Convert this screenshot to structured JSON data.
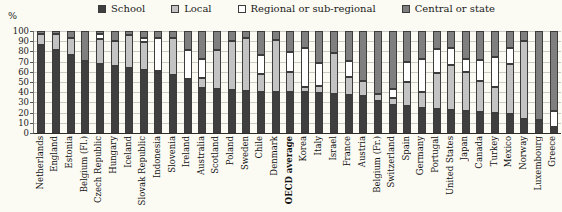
{
  "chart_data": {
    "type": "stacked-bar",
    "title": "",
    "ylabel": "%",
    "ylim": [
      0,
      100
    ],
    "yticks": [
      100,
      90,
      80,
      70,
      60,
      50,
      40,
      30,
      20,
      10,
      0
    ],
    "grid": true,
    "legend_position": "top",
    "legend": [
      {
        "key": "school",
        "label": "School",
        "color": "#3f3f3f"
      },
      {
        "key": "local",
        "label": "Local",
        "color": "#c3c3c3"
      },
      {
        "key": "regional",
        "label": "Regional or sub-regional",
        "color": "#ffffff"
      },
      {
        "key": "central",
        "label": "Central or state",
        "color": "#7f7f7f"
      }
    ],
    "rows": [
      {
        "country": "Netherlands",
        "school": 86,
        "local": 11,
        "regional": 0,
        "central": 3,
        "bold": false
      },
      {
        "country": "England",
        "school": 81,
        "local": 16,
        "regional": 0,
        "central": 3,
        "bold": false
      },
      {
        "country": "Estonia",
        "school": 76,
        "local": 17,
        "regional": 0,
        "central": 7,
        "bold": false
      },
      {
        "country": "Belgium (Fl.)",
        "school": 71,
        "local": 0,
        "regional": 0,
        "central": 29,
        "bold": false
      },
      {
        "country": "Czech Republic",
        "school": 68,
        "local": 24,
        "regional": 5,
        "central": 3,
        "bold": false
      },
      {
        "country": "Hungary",
        "school": 66,
        "local": 24,
        "regional": 0,
        "central": 10,
        "bold": false
      },
      {
        "country": "Iceland",
        "school": 64,
        "local": 32,
        "regional": 0,
        "central": 4,
        "bold": false
      },
      {
        "country": "Slovak Republic",
        "school": 62,
        "local": 27,
        "regional": 4,
        "central": 7,
        "bold": false
      },
      {
        "country": "Indonesia",
        "school": 59,
        "local": 2,
        "regional": 32,
        "central": 7,
        "bold": false
      },
      {
        "country": "Slovenia",
        "school": 57,
        "local": 36,
        "regional": 0,
        "central": 7,
        "bold": false
      },
      {
        "country": "Ireland",
        "school": 53,
        "local": 0,
        "regional": 28,
        "central": 19,
        "bold": false
      },
      {
        "country": "Australia",
        "school": 44,
        "local": 10,
        "regional": 19,
        "central": 27,
        "bold": false
      },
      {
        "country": "Scotland",
        "school": 43,
        "local": 38,
        "regional": 0,
        "central": 19,
        "bold": false
      },
      {
        "country": "Poland",
        "school": 42,
        "local": 48,
        "regional": 0,
        "central": 10,
        "bold": false
      },
      {
        "country": "Sweden",
        "school": 41,
        "local": 52,
        "regional": 0,
        "central": 7,
        "bold": false
      },
      {
        "country": "Chile",
        "school": 40,
        "local": 18,
        "regional": 18,
        "central": 24,
        "bold": false
      },
      {
        "country": "Denmark",
        "school": 40,
        "local": 51,
        "regional": 0,
        "central": 9,
        "bold": false
      },
      {
        "country": "OECD average",
        "school": 40,
        "local": 20,
        "regional": 19,
        "central": 21,
        "bold": true
      },
      {
        "country": "Korea",
        "school": 40,
        "local": 5,
        "regional": 38,
        "central": 17,
        "bold": false
      },
      {
        "country": "Italy",
        "school": 39,
        "local": 7,
        "regional": 23,
        "central": 31,
        "bold": false
      },
      {
        "country": "Israel",
        "school": 38,
        "local": 40,
        "regional": 0,
        "central": 22,
        "bold": false
      },
      {
        "country": "France",
        "school": 37,
        "local": 18,
        "regional": 16,
        "central": 29,
        "bold": false
      },
      {
        "country": "Austria",
        "school": 36,
        "local": 15,
        "regional": 0,
        "central": 49,
        "bold": false
      },
      {
        "country": "Belgium (Fr.)",
        "school": 31,
        "local": 7,
        "regional": 0,
        "central": 62,
        "bold": false
      },
      {
        "country": "Switzerland",
        "school": 27,
        "local": 7,
        "regional": 9,
        "central": 57,
        "bold": false
      },
      {
        "country": "Spain",
        "school": 26,
        "local": 24,
        "regional": 20,
        "central": 30,
        "bold": false
      },
      {
        "country": "Germany",
        "school": 25,
        "local": 15,
        "regional": 33,
        "central": 27,
        "bold": false
      },
      {
        "country": "Portugal",
        "school": 24,
        "local": 35,
        "regional": 23,
        "central": 18,
        "bold": false
      },
      {
        "country": "United States",
        "school": 23,
        "local": 44,
        "regional": 16,
        "central": 17,
        "bold": false
      },
      {
        "country": "Japan",
        "school": 22,
        "local": 38,
        "regional": 13,
        "central": 27,
        "bold": false
      },
      {
        "country": "Canada",
        "school": 21,
        "local": 30,
        "regional": 21,
        "central": 28,
        "bold": false
      },
      {
        "country": "Turkey",
        "school": 20,
        "local": 25,
        "regional": 30,
        "central": 25,
        "bold": false
      },
      {
        "country": "Mexico",
        "school": 19,
        "local": 49,
        "regional": 15,
        "central": 17,
        "bold": false
      },
      {
        "country": "Norway",
        "school": 14,
        "local": 76,
        "regional": 0,
        "central": 10,
        "bold": false
      },
      {
        "country": "Luxembourg",
        "school": 13,
        "local": 0,
        "regional": 0,
        "central": 87,
        "bold": false
      },
      {
        "country": "Greece",
        "school": 4,
        "local": 2,
        "regional": 16,
        "central": 78,
        "bold": false
      }
    ]
  },
  "colors": {
    "background": "#fbfaf3",
    "gridline": "#cbcbc6",
    "axis": "#2c2c2c",
    "segment_border": "#3c3c3c"
  }
}
